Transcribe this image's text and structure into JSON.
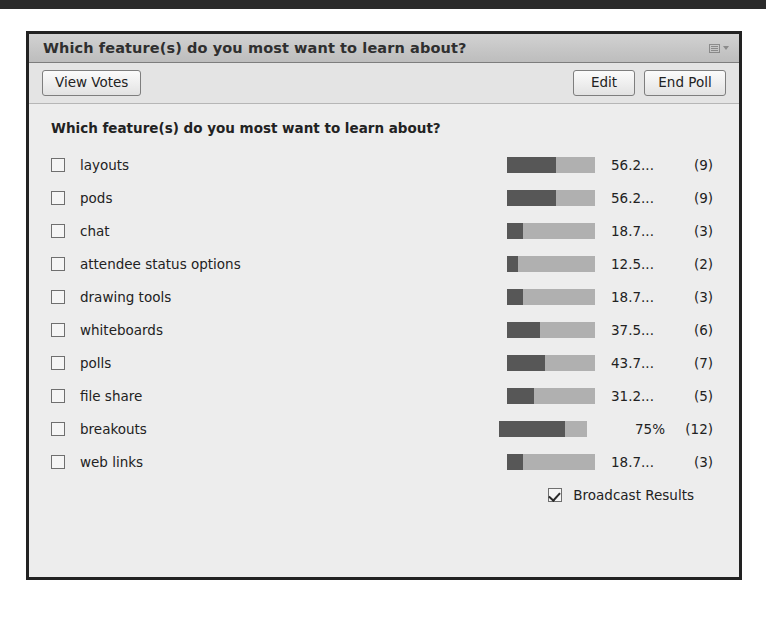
{
  "window": {
    "title": "Which feature(s) do you most want to learn about?",
    "menu_icon": "list-menu-icon",
    "caret_icon": "chevron-down-icon"
  },
  "toolbar": {
    "view_votes_label": "View Votes",
    "edit_label": "Edit",
    "end_poll_label": "End Poll"
  },
  "poll": {
    "question": "Which feature(s) do you most want to learn about?",
    "broadcast_label": "Broadcast Results",
    "broadcast_checked": true,
    "options": [
      {
        "label": "layouts",
        "percent_text": "56.2...",
        "count_text": "(9)",
        "percent": 56.2
      },
      {
        "label": "pods",
        "percent_text": "56.2...",
        "count_text": "(9)",
        "percent": 56.2
      },
      {
        "label": "chat",
        "percent_text": "18.7...",
        "count_text": "(3)",
        "percent": 18.7
      },
      {
        "label": "attendee status options",
        "percent_text": "12.5...",
        "count_text": "(2)",
        "percent": 12.5
      },
      {
        "label": "drawing tools",
        "percent_text": "18.7...",
        "count_text": "(3)",
        "percent": 18.7
      },
      {
        "label": "whiteboards",
        "percent_text": "37.5...",
        "count_text": "(6)",
        "percent": 37.5
      },
      {
        "label": "polls",
        "percent_text": "43.7...",
        "count_text": "(7)",
        "percent": 43.7
      },
      {
        "label": "file share",
        "percent_text": "31.2...",
        "count_text": "(5)",
        "percent": 31.2
      },
      {
        "label": "breakouts",
        "percent_text": "75%",
        "count_text": "(12)",
        "percent": 75.0
      },
      {
        "label": "web links",
        "percent_text": "18.7...",
        "count_text": "(3)",
        "percent": 18.7
      }
    ]
  },
  "chart_data": {
    "type": "bar",
    "title": "Which feature(s) do you most want to learn about?",
    "xlabel": "",
    "ylabel": "",
    "xlim": [
      0,
      100
    ],
    "grid": false,
    "legend": "none",
    "orientation": "horizontal",
    "categories": [
      "layouts",
      "pods",
      "chat",
      "attendee status options",
      "drawing tools",
      "whiteboards",
      "polls",
      "file share",
      "breakouts",
      "web links"
    ],
    "values": [
      56.2,
      56.2,
      18.7,
      12.5,
      18.7,
      37.5,
      43.7,
      31.2,
      75.0,
      18.7
    ],
    "counts": [
      9,
      9,
      3,
      2,
      3,
      6,
      7,
      5,
      12,
      3
    ],
    "value_labels": [
      "56.2...",
      "56.2...",
      "18.7...",
      "12.5...",
      "18.7...",
      "37.5...",
      "43.7...",
      "31.2...",
      "75%",
      "18.7..."
    ],
    "count_labels": [
      "(9)",
      "(9)",
      "(3)",
      "(2)",
      "(3)",
      "(6)",
      "(7)",
      "(5)",
      "(12)",
      "(3)"
    ],
    "colors": {
      "fill": "#575757",
      "track": "#b0b0b0"
    }
  },
  "colors": {
    "panel_bg": "#ededed",
    "titlebar_bg": "#c6c6c6",
    "toolbar_bg": "#e4e4e4",
    "border": "#222222",
    "bar_fill": "#575757",
    "bar_track": "#b0b0b0"
  }
}
